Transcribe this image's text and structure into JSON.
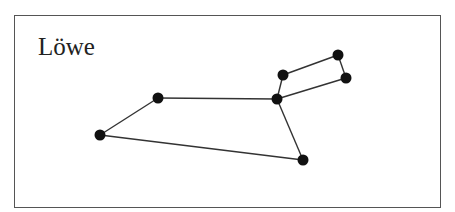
{
  "title": "Löwe",
  "colors": {
    "frame": "#555555",
    "line": "#333333",
    "star": "#111111"
  },
  "stars": [
    {
      "id": "s1",
      "x": 100,
      "y": 135
    },
    {
      "id": "s2",
      "x": 158,
      "y": 98
    },
    {
      "id": "s3",
      "x": 277,
      "y": 99
    },
    {
      "id": "s4",
      "x": 303,
      "y": 160
    },
    {
      "id": "s5",
      "x": 283,
      "y": 75
    },
    {
      "id": "s6",
      "x": 338,
      "y": 55
    },
    {
      "id": "s7",
      "x": 346,
      "y": 78
    }
  ],
  "edges": [
    [
      "s1",
      "s2"
    ],
    [
      "s2",
      "s3"
    ],
    [
      "s3",
      "s4"
    ],
    [
      "s4",
      "s1"
    ],
    [
      "s3",
      "s5"
    ],
    [
      "s5",
      "s6"
    ],
    [
      "s6",
      "s7"
    ],
    [
      "s7",
      "s3"
    ]
  ]
}
